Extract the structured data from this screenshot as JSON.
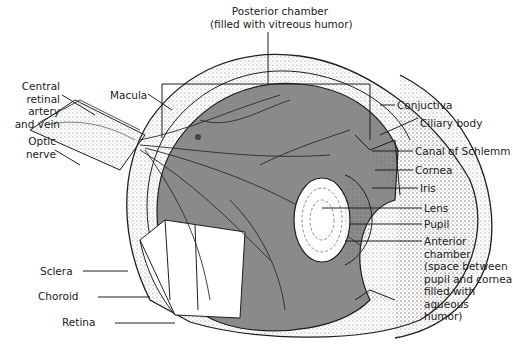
{
  "diagram": {
    "colors": {
      "vitreous": "#8a8a8a",
      "line": "#1e1e1e",
      "background": "#ffffff",
      "text": "#222222"
    },
    "labels": {
      "posterior_chamber_1": "Posterior chamber",
      "posterior_chamber_2": "(filled with vitreous humor)",
      "central_retinal_1": "Central",
      "central_retinal_2": "retinal",
      "central_retinal_3": "artery",
      "central_retinal_4": "and vein",
      "optic_1": "Optic",
      "optic_2": "nerve",
      "macula": "Macula",
      "sclera": "Sclera",
      "choroid": "Choroid",
      "retina": "Retina",
      "conjuctiva": "Conjuctiva",
      "ciliary_body": "Ciliary body",
      "canal_of_schlemm": "Canal of Schlemm",
      "cornea": "Cornea",
      "iris": "Iris",
      "lens": "Lens",
      "pupil": "Pupil",
      "anterior_1": "Anterior",
      "anterior_2": "chamber",
      "anterior_3": "(space between",
      "anterior_4": "pupil and cornea",
      "anterior_5": "filled with",
      "anterior_6": "aqueous",
      "anterior_7": "humor)"
    }
  }
}
